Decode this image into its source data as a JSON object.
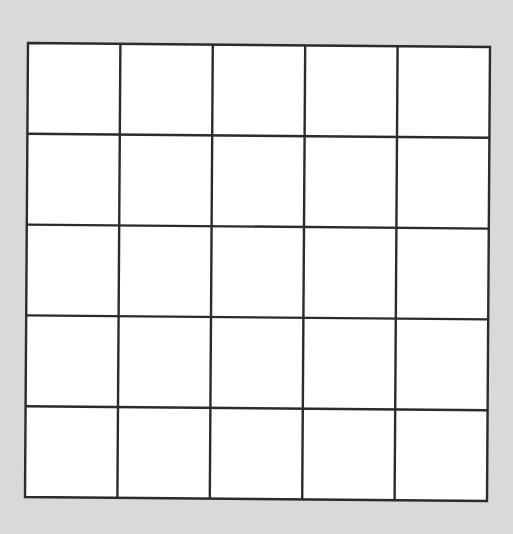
{
  "page": {
    "background": "#d9d9d9",
    "width": 513,
    "height": 534
  },
  "grid": {
    "rows": 5,
    "cols": 5,
    "fill": "#ffffff",
    "stroke": "#2b2b2b",
    "stroke_width": 2.4,
    "corners": {
      "top_left": [
        28,
        43
      ],
      "top_right": [
        490,
        47
      ],
      "bottom_right": [
        487,
        501
      ],
      "bottom_left": [
        25,
        497
      ]
    },
    "cells": [
      [
        "",
        "",
        "",
        "",
        ""
      ],
      [
        "",
        "",
        "",
        "",
        ""
      ],
      [
        "",
        "",
        "",
        "",
        ""
      ],
      [
        "",
        "",
        "",
        "",
        ""
      ],
      [
        "",
        "",
        "",
        "",
        ""
      ]
    ]
  }
}
